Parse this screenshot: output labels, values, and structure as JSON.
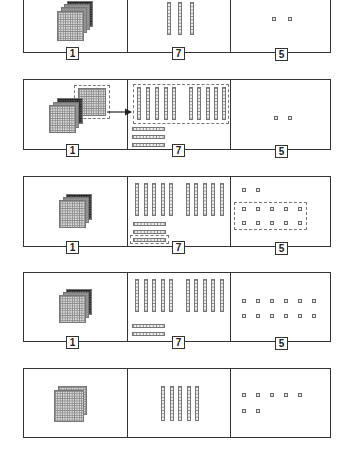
{
  "diagram": {
    "columns": [
      "hundreds",
      "tens",
      "ones"
    ],
    "panels": [
      {
        "step": 1,
        "labels": [
          "1",
          "7",
          "5"
        ],
        "hundreds": 4,
        "tens": 3,
        "ones": 2,
        "note": "top panel (cropped)"
      },
      {
        "step": 2,
        "labels": [
          "1",
          "7",
          "5"
        ],
        "hundreds": 3,
        "tens_vertical": 10,
        "tens_horizontal": 3,
        "ones": 2,
        "arrow": "one hundred flat regrouped into 10 tens"
      },
      {
        "step": 3,
        "labels": [
          "1",
          "7",
          "5"
        ],
        "hundreds": 3,
        "tens_vertical": 10,
        "tens_horizontal": 3,
        "ones": 12,
        "arrow": "one ten rod regrouped into 10 ones"
      },
      {
        "step": 4,
        "labels": [
          "1",
          "7",
          "5"
        ],
        "hundreds": 3,
        "tens_vertical": 10,
        "tens_horizontal": 2,
        "ones": 12
      },
      {
        "step": 5,
        "labels": [],
        "hundreds": 2,
        "tens": 5,
        "ones": 7,
        "note": "result"
      }
    ]
  },
  "labels": {
    "hundreds": "1",
    "tens": "7",
    "ones": "5"
  }
}
